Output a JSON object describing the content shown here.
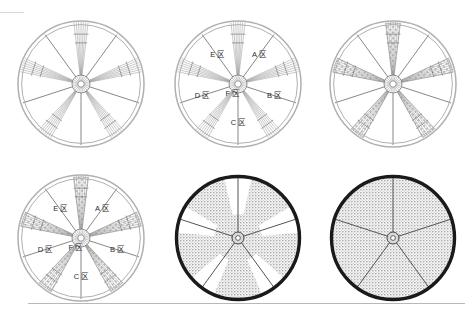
{
  "figure": {
    "width": 475,
    "height": 316,
    "background_color": "#ffffff",
    "rows": 2,
    "columns": 3,
    "panel_count": 6
  },
  "colors": {
    "rim_light": "#b0b0b0",
    "rim_dark": "#1a1a1a",
    "spoke_thin": "#555555",
    "spoke_band": "#888888",
    "hatch_fill": "#9a9a9a",
    "stipple_fill": "#bdbdbd",
    "label_text": "#2b2b2b",
    "rule": "#bbbbbb",
    "hub": "#777777"
  },
  "geometry": {
    "radius": 63,
    "hub_radius": 9,
    "spoke_count_thin": 5,
    "spoke_band_count": 5,
    "band_half_width_deg": 7,
    "band_angles_deg": [
      -90,
      -18,
      54,
      126,
      198
    ],
    "thin_angles_deg": [
      -54,
      18,
      90,
      162,
      234
    ]
  },
  "panels": [
    {
      "id": "panel-1",
      "name": "wheel-plain-spokes",
      "index": 1,
      "center_x": 81,
      "center_y": 84,
      "rim_style": "light-double",
      "band_style": "lines",
      "sector_fill": "none",
      "labels": []
    },
    {
      "id": "panel-2",
      "name": "wheel-labeled-zones",
      "index": 2,
      "center_x": 238,
      "center_y": 84,
      "rim_style": "light-double",
      "band_style": "lines",
      "sector_fill": "none",
      "labels": [
        {
          "text": "A 区",
          "angle_deg": -54,
          "radius_frac": 0.56
        },
        {
          "text": "B 区",
          "angle_deg": 18,
          "radius_frac": 0.6
        },
        {
          "text": "C 区",
          "angle_deg": 90,
          "radius_frac": 0.62
        },
        {
          "text": "D 区",
          "angle_deg": 162,
          "radius_frac": 0.6
        },
        {
          "text": "E 区",
          "angle_deg": 234,
          "radius_frac": 0.56
        },
        {
          "text": "F 区",
          "angle_deg": 120,
          "radius_frac": 0.18
        }
      ]
    },
    {
      "id": "panel-3",
      "name": "wheel-hatched-bands",
      "index": 3,
      "center_x": 393,
      "center_y": 84,
      "rim_style": "light-double",
      "band_style": "hatched",
      "sector_fill": "none",
      "labels": []
    },
    {
      "id": "panel-4",
      "name": "wheel-hatched-bands-labeled",
      "index": 4,
      "center_x": 81,
      "center_y": 238,
      "rim_style": "light-double",
      "band_style": "hatched",
      "sector_fill": "none",
      "labels": [
        {
          "text": "A 区",
          "angle_deg": -54,
          "radius_frac": 0.56
        },
        {
          "text": "B 区",
          "angle_deg": 18,
          "radius_frac": 0.6
        },
        {
          "text": "C 区",
          "angle_deg": 90,
          "radius_frac": 0.62
        },
        {
          "text": "D 区",
          "angle_deg": 162,
          "radius_frac": 0.6
        },
        {
          "text": "E 区",
          "angle_deg": 234,
          "radius_frac": 0.56
        },
        {
          "text": "F 区",
          "angle_deg": 120,
          "radius_frac": 0.18
        }
      ]
    },
    {
      "id": "panel-5",
      "name": "wheel-partial-stipple-disc",
      "index": 5,
      "center_x": 238,
      "center_y": 238,
      "rim_style": "dark-thick",
      "band_style": "none",
      "sector_fill": "partial-stipple",
      "labels": []
    },
    {
      "id": "panel-6",
      "name": "wheel-full-stipple-disc",
      "index": 6,
      "center_x": 393,
      "center_y": 238,
      "rim_style": "dark-thick",
      "band_style": "none",
      "sector_fill": "full-stipple",
      "labels": []
    }
  ],
  "rules": {
    "top_rule_label": "top-left hairline rule",
    "bottom_rule_label": "bottom horizontal rule"
  }
}
